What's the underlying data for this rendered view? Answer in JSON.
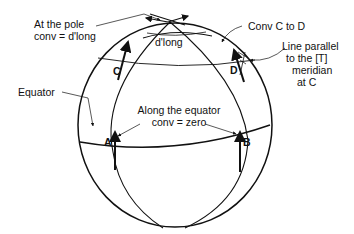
{
  "diagram": {
    "labels": {
      "pole_line1": "At the pole",
      "pole_line2": "conv = d'long",
      "dlong": "d'long",
      "conv_cd": "Conv C to D",
      "parallel_line1": "Line parallel",
      "parallel_line2": "to the [T]",
      "parallel_line3": "meridian",
      "parallel_line4": "at C",
      "equator": "Equator",
      "along_line1": "Along the equator",
      "along_line2": "conv = zero"
    },
    "points": {
      "a": "A",
      "b": "B",
      "c": "C",
      "d": "D"
    },
    "colors": {
      "line": "#111111",
      "background": "#ffffff"
    }
  }
}
